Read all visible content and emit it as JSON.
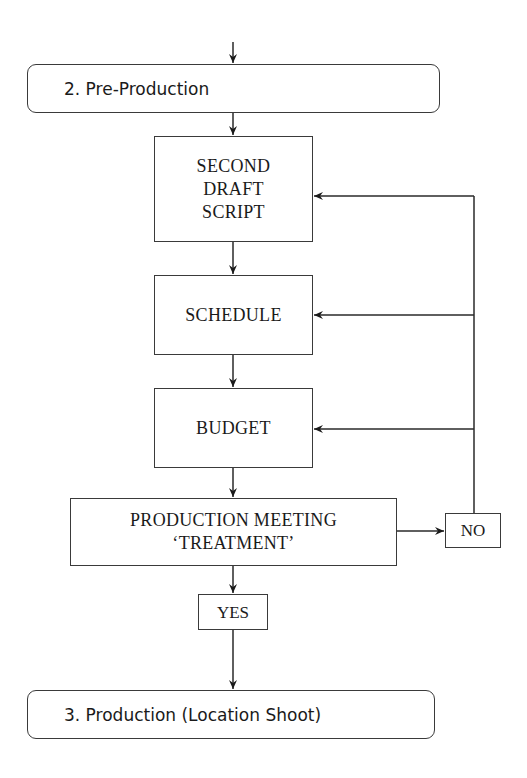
{
  "diagram": {
    "phase_start": {
      "label": "2. Pre-Production"
    },
    "steps": [
      {
        "id": "second-draft-script",
        "lines": [
          "SECOND",
          "DRAFT",
          "SCRIPT"
        ]
      },
      {
        "id": "schedule",
        "lines": [
          "SCHEDULE"
        ]
      },
      {
        "id": "budget",
        "lines": [
          "BUDGET"
        ]
      },
      {
        "id": "production-meeting",
        "lines": [
          "PRODUCTION MEETING",
          "‘TREATMENT’"
        ]
      }
    ],
    "decision": {
      "no_label": "NO",
      "yes_label": "YES"
    },
    "phase_end": {
      "label": "3. Production (Location Shoot)"
    },
    "edges": [
      {
        "from": "entry",
        "to": "2. Pre-Production"
      },
      {
        "from": "2. Pre-Production",
        "to": "SECOND DRAFT SCRIPT"
      },
      {
        "from": "SECOND DRAFT SCRIPT",
        "to": "SCHEDULE"
      },
      {
        "from": "SCHEDULE",
        "to": "BUDGET"
      },
      {
        "from": "BUDGET",
        "to": "PRODUCTION MEETING 'TREATMENT'"
      },
      {
        "from": "PRODUCTION MEETING 'TREATMENT'",
        "to": "NO"
      },
      {
        "from": "NO",
        "to": "SECOND DRAFT SCRIPT"
      },
      {
        "from": "NO",
        "to": "SCHEDULE"
      },
      {
        "from": "NO",
        "to": "BUDGET"
      },
      {
        "from": "PRODUCTION MEETING 'TREATMENT'",
        "to": "YES"
      },
      {
        "from": "YES",
        "to": "3. Production (Location Shoot)"
      }
    ],
    "colors": {
      "line": "#2a2a2a",
      "text": "#1a1a1a",
      "background": "#ffffff"
    }
  }
}
